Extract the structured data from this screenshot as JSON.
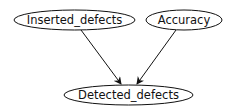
{
  "diagram": {
    "type": "directed-graph",
    "nodes": [
      {
        "id": "inserted",
        "label": "Inserted_defects",
        "cx": 74.5,
        "cy": 20,
        "rx": 60.5,
        "ry": 10
      },
      {
        "id": "accuracy",
        "label": "Accuracy",
        "cx": 184,
        "cy": 20,
        "rx": 38,
        "ry": 10
      },
      {
        "id": "detected",
        "label": "Detected_defects",
        "cx": 128.5,
        "cy": 95,
        "rx": 64.5,
        "ry": 10
      }
    ],
    "edges": [
      {
        "from": "inserted",
        "to": "detected"
      },
      {
        "from": "accuracy",
        "to": "detected"
      }
    ],
    "colors": {
      "stroke": "#111111",
      "background": "#ffffff"
    }
  }
}
